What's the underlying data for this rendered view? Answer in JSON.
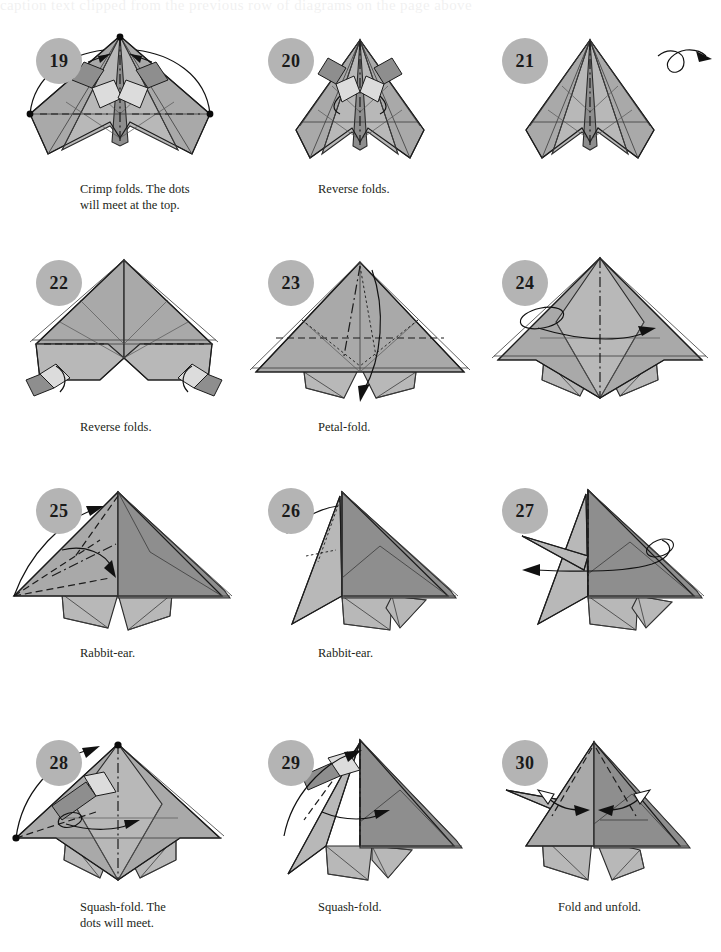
{
  "page": {
    "top_bleed_text": "caption text clipped from the previous row of diagrams on the page above",
    "background_color": "#ffffff",
    "paper_color": "#a9a9a9",
    "badge_color": "#b4b4b4",
    "ink_color": "#231f20"
  },
  "rows": [
    {
      "id": "row-1",
      "steps": [
        {
          "number": "19",
          "caption": "Crimp folds. The dots\nwill meet at the top.",
          "figure": "fig-19"
        },
        {
          "number": "20",
          "caption": "Reverse folds.",
          "figure": "fig-20"
        },
        {
          "number": "21",
          "caption": "",
          "figure": "fig-21"
        }
      ]
    },
    {
      "id": "row-2",
      "steps": [
        {
          "number": "22",
          "caption": "Reverse folds.",
          "figure": "fig-22"
        },
        {
          "number": "23",
          "caption": "Petal-fold.",
          "figure": "fig-23"
        },
        {
          "number": "24",
          "caption": "",
          "figure": "fig-24"
        }
      ]
    },
    {
      "id": "row-3",
      "steps": [
        {
          "number": "25",
          "caption": "Rabbit-ear.",
          "figure": "fig-25"
        },
        {
          "number": "26",
          "caption": "Rabbit-ear.",
          "figure": "fig-26"
        },
        {
          "number": "27",
          "caption": "",
          "figure": "fig-27"
        }
      ]
    },
    {
      "id": "row-4",
      "steps": [
        {
          "number": "28",
          "caption": "Squash-fold. The\ndots will meet.",
          "figure": "fig-28"
        },
        {
          "number": "29",
          "caption": "Squash-fold.",
          "figure": "fig-29"
        },
        {
          "number": "30",
          "caption": "Fold and unfold.",
          "figure": "fig-30"
        }
      ]
    }
  ]
}
